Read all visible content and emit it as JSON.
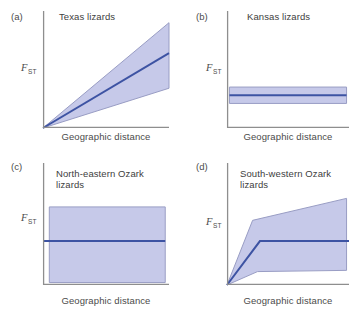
{
  "figure": {
    "background": "#ffffff",
    "ylabel_main": "F",
    "ylabel_sub": "ST",
    "xlabel": "Geographic distance",
    "colors": {
      "band_fill": "#c6c9e9",
      "band_border": "#999dc4",
      "median_line": "#3d53a3",
      "axis": "#8e8e8e",
      "text": "#4b4b4b"
    }
  },
  "chart_data": [
    {
      "type": "area",
      "panel_label": "(a)",
      "title": "Texas lizards",
      "xlabel": "Geographic distance",
      "ylabel": "FST",
      "x_range": [
        0,
        1
      ],
      "y_range": [
        0,
        1
      ],
      "grid": false,
      "legend": false,
      "description": "FST rises linearly with geographic distance; confidence band widens from the origin",
      "band_polygon": [
        [
          0,
          0
        ],
        [
          1,
          0.9
        ],
        [
          1,
          0.34
        ]
      ],
      "median_line": [
        [
          0,
          0
        ],
        [
          1,
          0.64
        ]
      ]
    },
    {
      "type": "area",
      "panel_label": "(b)",
      "title": "Kansas lizards",
      "xlabel": "Geographic distance",
      "ylabel": "FST",
      "x_range": [
        0,
        1
      ],
      "y_range": [
        0,
        1
      ],
      "grid": false,
      "legend": false,
      "description": "FST flat and low across all distances; narrow horizontal confidence band",
      "band_polygon": [
        [
          0.02,
          0.35
        ],
        [
          0.98,
          0.35
        ],
        [
          0.98,
          0.21
        ],
        [
          0.02,
          0.21
        ]
      ],
      "median_line": [
        [
          0.02,
          0.28
        ],
        [
          0.98,
          0.28
        ]
      ]
    },
    {
      "type": "area",
      "panel_label": "(c)",
      "title": "North-eastern Ozark lizards",
      "xlabel": "Geographic distance",
      "ylabel": "FST",
      "x_range": [
        0,
        1
      ],
      "y_range": [
        0,
        1
      ],
      "grid": false,
      "legend": false,
      "description": "FST flat at mid level with very wide confidence band spanning most of the plot",
      "band_polygon": [
        [
          0.05,
          0.64
        ],
        [
          0.97,
          0.64
        ],
        [
          0.97,
          0.02
        ],
        [
          0.05,
          0.02
        ]
      ],
      "median_line": [
        [
          0,
          0.36
        ],
        [
          0.97,
          0.36
        ]
      ]
    },
    {
      "type": "area",
      "panel_label": "(d)",
      "title": "South-western Ozark lizards",
      "xlabel": "Geographic distance",
      "ylabel": "FST",
      "x_range": [
        0,
        1
      ],
      "y_range": [
        0,
        1
      ],
      "grid": false,
      "legend": false,
      "description": "FST climbs steeply at short distances then plateaus; fan-shaped confidence band widening to the right",
      "band_polygon": [
        [
          0,
          0
        ],
        [
          0.21,
          0.53
        ],
        [
          0.98,
          0.71
        ],
        [
          0.98,
          0.12
        ],
        [
          0.25,
          0.11
        ]
      ],
      "median_line": [
        [
          0,
          0
        ],
        [
          0.27,
          0.36
        ],
        [
          1,
          0.36
        ]
      ]
    }
  ]
}
